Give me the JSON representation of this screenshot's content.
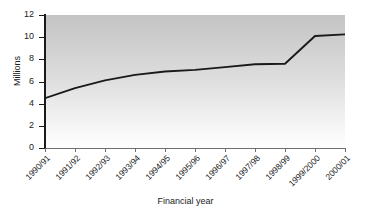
{
  "chart_data": {
    "type": "line",
    "title": "",
    "subtitle": "",
    "xlabel": "Financial year",
    "ylabel": "Millions",
    "categories": [
      "1990/91",
      "1991/92",
      "1992/93",
      "1993/94",
      "1994/95",
      "1995/96",
      "1996/97",
      "1997/98",
      "1998/99",
      "1999/2000",
      "2000/01"
    ],
    "values": [
      4.5,
      5.4,
      6.1,
      6.6,
      6.9,
      7.05,
      7.3,
      7.55,
      7.6,
      10.1,
      10.25
    ],
    "series": [
      {
        "name": "Millions",
        "values": [
          4.5,
          5.4,
          6.1,
          6.6,
          6.9,
          7.05,
          7.3,
          7.55,
          7.6,
          10.1,
          10.25
        ]
      }
    ],
    "ylim": [
      0,
      12
    ],
    "ytick_labels": [
      "0",
      "2",
      "4",
      "6",
      "8",
      "10",
      "12"
    ],
    "ytick_values": [
      0,
      2,
      4,
      6,
      8,
      10,
      12
    ],
    "grid": false,
    "legend": false,
    "legend_position": "none",
    "line_color": "#1a1a1a",
    "plot_background_top": "#c4c4c4",
    "plot_background_bottom": "#fdfdfd",
    "axis_color": "#1a1a1a"
  }
}
